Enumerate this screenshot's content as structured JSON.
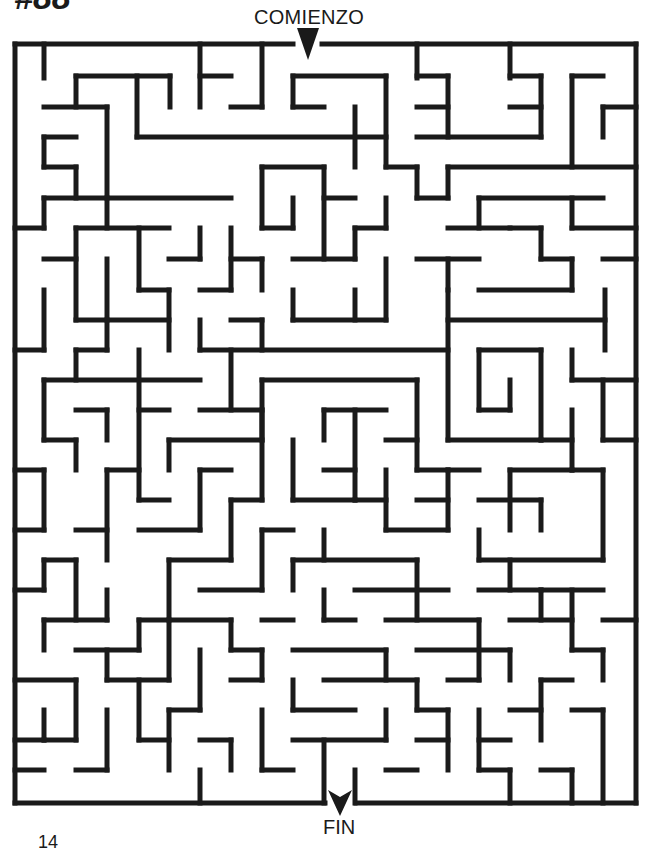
{
  "header": {
    "puzzle_number": "#88",
    "start_label": "COMIENZO"
  },
  "footer": {
    "end_label": "FIN",
    "page_number": "14"
  },
  "maze": {
    "stroke_color": "#1a1a1a",
    "stroke_width": 5,
    "columns": 20,
    "rows": 25,
    "outer_box": {
      "left": 15,
      "top": 44,
      "right": 636,
      "bottom": 803
    },
    "entrance": {
      "label": "COMIENZO",
      "x_from": 293,
      "x_to": 322,
      "arrow_x": 308,
      "arrow_y": 44
    },
    "exit": {
      "label": "FIN",
      "x_from": 325,
      "x_to": 356,
      "arrow_x": 340,
      "arrow_y": 803
    },
    "walls": [
      [
        15,
        44,
        293,
        44
      ],
      [
        322,
        44,
        636,
        44
      ],
      [
        636,
        44,
        636,
        803
      ],
      [
        15,
        803,
        325,
        803
      ],
      [
        356,
        803,
        636,
        803
      ],
      [
        15,
        44,
        15,
        803
      ],
      [
        44,
        44,
        44,
        78
      ],
      [
        200,
        44,
        200,
        107
      ],
      [
        262,
        44,
        262,
        107
      ],
      [
        417,
        44,
        417,
        78
      ],
      [
        510,
        44,
        510,
        78
      ],
      [
        76,
        76,
        170,
        76
      ],
      [
        76,
        76,
        76,
        107
      ],
      [
        137,
        76,
        137,
        137
      ],
      [
        170,
        76,
        170,
        107
      ],
      [
        200,
        76,
        231,
        76
      ],
      [
        293,
        76,
        386,
        76
      ],
      [
        293,
        76,
        293,
        107
      ],
      [
        386,
        76,
        386,
        167
      ],
      [
        417,
        76,
        448,
        76
      ],
      [
        448,
        76,
        448,
        137
      ],
      [
        510,
        76,
        541,
        76
      ],
      [
        541,
        76,
        541,
        137
      ],
      [
        572,
        76,
        603,
        76
      ],
      [
        572,
        76,
        572,
        167
      ],
      [
        44,
        107,
        107,
        107
      ],
      [
        107,
        107,
        107,
        198
      ],
      [
        231,
        107,
        262,
        107
      ],
      [
        293,
        107,
        324,
        107
      ],
      [
        355,
        107,
        355,
        167
      ],
      [
        417,
        107,
        448,
        107
      ],
      [
        510,
        107,
        541,
        107
      ],
      [
        603,
        107,
        636,
        107
      ],
      [
        603,
        107,
        603,
        137
      ],
      [
        44,
        137,
        76,
        137
      ],
      [
        44,
        137,
        44,
        167
      ],
      [
        137,
        137,
        386,
        137
      ],
      [
        417,
        137,
        541,
        137
      ],
      [
        44,
        167,
        76,
        167
      ],
      [
        76,
        167,
        76,
        198
      ],
      [
        262,
        167,
        324,
        167
      ],
      [
        262,
        167,
        262,
        228
      ],
      [
        324,
        167,
        324,
        259
      ],
      [
        386,
        167,
        417,
        167
      ],
      [
        417,
        167,
        417,
        198
      ],
      [
        448,
        167,
        636,
        167
      ],
      [
        448,
        167,
        448,
        198
      ],
      [
        44,
        198,
        231,
        198
      ],
      [
        44,
        198,
        44,
        228
      ],
      [
        107,
        198,
        107,
        228
      ],
      [
        293,
        198,
        293,
        228
      ],
      [
        324,
        198,
        355,
        198
      ],
      [
        386,
        198,
        386,
        228
      ],
      [
        417,
        198,
        448,
        198
      ],
      [
        479,
        198,
        603,
        198
      ],
      [
        479,
        198,
        479,
        228
      ],
      [
        572,
        198,
        572,
        228
      ],
      [
        15,
        228,
        44,
        228
      ],
      [
        76,
        228,
        169,
        228
      ],
      [
        76,
        228,
        76,
        320
      ],
      [
        139,
        228,
        139,
        290
      ],
      [
        200,
        228,
        200,
        259
      ],
      [
        231,
        228,
        231,
        290
      ],
      [
        262,
        228,
        293,
        228
      ],
      [
        355,
        228,
        386,
        228
      ],
      [
        355,
        228,
        355,
        259
      ],
      [
        448,
        228,
        510,
        228
      ],
      [
        510,
        228,
        541,
        228
      ],
      [
        541,
        228,
        541,
        259
      ],
      [
        572,
        228,
        636,
        228
      ],
      [
        44,
        259,
        76,
        259
      ],
      [
        169,
        259,
        200,
        259
      ],
      [
        293,
        259,
        355,
        259
      ],
      [
        386,
        259,
        386,
        320
      ],
      [
        417,
        259,
        479,
        259
      ],
      [
        448,
        259,
        448,
        290
      ],
      [
        541,
        259,
        572,
        259
      ],
      [
        572,
        259,
        572,
        290
      ],
      [
        603,
        259,
        636,
        259
      ],
      [
        44,
        290,
        44,
        350
      ],
      [
        107,
        259,
        107,
        320
      ],
      [
        139,
        290,
        169,
        290
      ],
      [
        169,
        290,
        169,
        350
      ],
      [
        200,
        290,
        231,
        290
      ],
      [
        231,
        259,
        262,
        259
      ],
      [
        262,
        259,
        262,
        290
      ],
      [
        293,
        290,
        293,
        320
      ],
      [
        355,
        290,
        355,
        320
      ],
      [
        479,
        290,
        572,
        290
      ],
      [
        605,
        290,
        605,
        350
      ],
      [
        15,
        350,
        44,
        350
      ],
      [
        76,
        320,
        169,
        320
      ],
      [
        200,
        320,
        200,
        350
      ],
      [
        262,
        320,
        262,
        350
      ],
      [
        231,
        320,
        262,
        320
      ],
      [
        293,
        320,
        386,
        320
      ],
      [
        448,
        290,
        448,
        440
      ],
      [
        448,
        320,
        605,
        320
      ],
      [
        76,
        350,
        107,
        350
      ],
      [
        76,
        350,
        76,
        380
      ],
      [
        107,
        320,
        107,
        350
      ],
      [
        200,
        350,
        448,
        350
      ],
      [
        479,
        350,
        541,
        350
      ],
      [
        479,
        350,
        479,
        410
      ],
      [
        541,
        350,
        541,
        440
      ],
      [
        572,
        350,
        572,
        380
      ],
      [
        572,
        380,
        636,
        380
      ],
      [
        44,
        380,
        200,
        380
      ],
      [
        44,
        380,
        44,
        440
      ],
      [
        139,
        350,
        139,
        500
      ],
      [
        231,
        350,
        231,
        410
      ],
      [
        262,
        380,
        417,
        380
      ],
      [
        262,
        380,
        262,
        440
      ],
      [
        417,
        380,
        417,
        470
      ],
      [
        510,
        380,
        510,
        410
      ],
      [
        479,
        410,
        510,
        410
      ],
      [
        76,
        410,
        107,
        410
      ],
      [
        107,
        410,
        107,
        440
      ],
      [
        139,
        410,
        169,
        410
      ],
      [
        200,
        410,
        262,
        410
      ],
      [
        324,
        410,
        386,
        410
      ],
      [
        324,
        410,
        324,
        440
      ],
      [
        448,
        440,
        541,
        440
      ],
      [
        572,
        410,
        572,
        470
      ],
      [
        603,
        380,
        603,
        440
      ],
      [
        603,
        440,
        636,
        440
      ],
      [
        44,
        440,
        76,
        440
      ],
      [
        169,
        440,
        262,
        440
      ],
      [
        169,
        440,
        169,
        470
      ],
      [
        262,
        410,
        262,
        500
      ],
      [
        355,
        410,
        355,
        500
      ],
      [
        386,
        440,
        417,
        440
      ],
      [
        417,
        470,
        448,
        470
      ],
      [
        448,
        470,
        479,
        470
      ],
      [
        541,
        440,
        572,
        440
      ],
      [
        15,
        470,
        44,
        470
      ],
      [
        44,
        470,
        44,
        530
      ],
      [
        76,
        440,
        76,
        470
      ],
      [
        107,
        470,
        139,
        470
      ],
      [
        107,
        470,
        107,
        560
      ],
      [
        200,
        470,
        231,
        470
      ],
      [
        200,
        470,
        200,
        530
      ],
      [
        293,
        440,
        293,
        500
      ],
      [
        324,
        470,
        355,
        470
      ],
      [
        386,
        470,
        386,
        530
      ],
      [
        448,
        470,
        448,
        530
      ],
      [
        510,
        470,
        510,
        530
      ],
      [
        510,
        470,
        572,
        470
      ],
      [
        572,
        470,
        603,
        470
      ],
      [
        603,
        470,
        603,
        560
      ],
      [
        139,
        500,
        169,
        500
      ],
      [
        231,
        500,
        262,
        500
      ],
      [
        231,
        500,
        231,
        560
      ],
      [
        293,
        500,
        355,
        500
      ],
      [
        355,
        500,
        386,
        500
      ],
      [
        417,
        500,
        448,
        500
      ],
      [
        479,
        500,
        541,
        500
      ],
      [
        541,
        500,
        541,
        530
      ],
      [
        15,
        530,
        44,
        530
      ],
      [
        76,
        530,
        107,
        530
      ],
      [
        139,
        530,
        200,
        530
      ],
      [
        262,
        530,
        293,
        530
      ],
      [
        262,
        530,
        262,
        590
      ],
      [
        324,
        530,
        324,
        560
      ],
      [
        386,
        530,
        448,
        530
      ],
      [
        479,
        530,
        479,
        560
      ],
      [
        479,
        560,
        603,
        560
      ],
      [
        44,
        560,
        76,
        560
      ],
      [
        44,
        560,
        44,
        590
      ],
      [
        76,
        560,
        76,
        620
      ],
      [
        169,
        560,
        231,
        560
      ],
      [
        169,
        560,
        169,
        620
      ],
      [
        293,
        560,
        417,
        560
      ],
      [
        293,
        560,
        293,
        590
      ],
      [
        417,
        560,
        417,
        620
      ],
      [
        510,
        560,
        510,
        590
      ],
      [
        541,
        590,
        603,
        590
      ],
      [
        15,
        590,
        44,
        590
      ],
      [
        107,
        590,
        107,
        620
      ],
      [
        200,
        590,
        262,
        590
      ],
      [
        324,
        590,
        324,
        620
      ],
      [
        355,
        590,
        448,
        590
      ],
      [
        479,
        590,
        541,
        590
      ],
      [
        541,
        590,
        541,
        620
      ],
      [
        572,
        590,
        572,
        650
      ],
      [
        44,
        620,
        107,
        620
      ],
      [
        44,
        620,
        44,
        650
      ],
      [
        139,
        620,
        231,
        620
      ],
      [
        139,
        620,
        139,
        650
      ],
      [
        231,
        620,
        231,
        650
      ],
      [
        262,
        620,
        293,
        620
      ],
      [
        324,
        620,
        355,
        620
      ],
      [
        386,
        620,
        479,
        620
      ],
      [
        479,
        620,
        479,
        680
      ],
      [
        510,
        620,
        572,
        620
      ],
      [
        603,
        620,
        636,
        620
      ],
      [
        76,
        650,
        139,
        650
      ],
      [
        107,
        650,
        107,
        680
      ],
      [
        169,
        620,
        169,
        680
      ],
      [
        200,
        650,
        200,
        710
      ],
      [
        231,
        650,
        262,
        650
      ],
      [
        262,
        650,
        262,
        680
      ],
      [
        293,
        650,
        386,
        650
      ],
      [
        386,
        650,
        386,
        680
      ],
      [
        417,
        650,
        510,
        650
      ],
      [
        510,
        650,
        510,
        680
      ],
      [
        572,
        650,
        603,
        650
      ],
      [
        603,
        650,
        603,
        680
      ],
      [
        15,
        680,
        76,
        680
      ],
      [
        76,
        680,
        76,
        740
      ],
      [
        107,
        680,
        169,
        680
      ],
      [
        139,
        680,
        139,
        740
      ],
      [
        231,
        680,
        262,
        680
      ],
      [
        293,
        680,
        293,
        710
      ],
      [
        324,
        680,
        417,
        680
      ],
      [
        417,
        680,
        417,
        710
      ],
      [
        448,
        680,
        479,
        680
      ],
      [
        541,
        680,
        572,
        680
      ],
      [
        541,
        680,
        541,
        740
      ],
      [
        572,
        710,
        603,
        710
      ],
      [
        44,
        710,
        44,
        740
      ],
      [
        107,
        710,
        107,
        770
      ],
      [
        169,
        710,
        200,
        710
      ],
      [
        169,
        710,
        169,
        770
      ],
      [
        262,
        710,
        262,
        770
      ],
      [
        293,
        710,
        355,
        710
      ],
      [
        386,
        710,
        386,
        740
      ],
      [
        417,
        710,
        448,
        710
      ],
      [
        448,
        710,
        448,
        770
      ],
      [
        479,
        710,
        479,
        770
      ],
      [
        510,
        710,
        541,
        710
      ],
      [
        603,
        710,
        603,
        803
      ],
      [
        15,
        740,
        44,
        740
      ],
      [
        44,
        740,
        76,
        740
      ],
      [
        139,
        740,
        169,
        740
      ],
      [
        200,
        740,
        231,
        740
      ],
      [
        231,
        740,
        231,
        770
      ],
      [
        293,
        740,
        386,
        740
      ],
      [
        324,
        740,
        324,
        803
      ],
      [
        355,
        770,
        355,
        803
      ],
      [
        417,
        740,
        448,
        740
      ],
      [
        479,
        740,
        510,
        740
      ],
      [
        541,
        770,
        572,
        770
      ],
      [
        572,
        770,
        572,
        803
      ],
      [
        15,
        770,
        44,
        770
      ],
      [
        76,
        770,
        107,
        770
      ],
      [
        200,
        770,
        200,
        803
      ],
      [
        262,
        770,
        293,
        770
      ],
      [
        386,
        770,
        417,
        770
      ],
      [
        479,
        770,
        510,
        770
      ],
      [
        510,
        770,
        510,
        803
      ]
    ]
  }
}
